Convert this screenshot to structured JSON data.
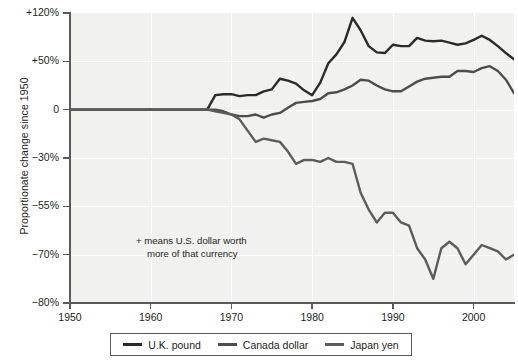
{
  "chart_data": {
    "type": "line",
    "title": "",
    "xlabel": "",
    "ylabel": "Proportionate change since 1950",
    "annotation": {
      "line1": "+ means U.S. dollar worth",
      "line2": "more of that currency"
    },
    "legend_position": "bottom",
    "grid": true,
    "background_color": "#f1f1ef",
    "gridline_color": "#ffffff",
    "axis_color": "#58595b",
    "xlim": [
      1950,
      2005
    ],
    "x_ticks": [
      1950,
      1960,
      1970,
      1980,
      1990,
      2000
    ],
    "x_tick_labels": [
      "1950",
      "1960",
      "1970",
      "1980",
      "1990",
      "2000"
    ],
    "y_ticks": [
      120,
      50,
      0,
      -30,
      -55,
      -70,
      -80
    ],
    "y_tick_labels": [
      "+120%",
      "+50%",
      "0",
      "-30%",
      "-55%",
      "-70%",
      "-80%"
    ],
    "y_axis_scale": "non-linear (equal pixel spacing between listed ticks)",
    "series": [
      {
        "name": "U.K. pound",
        "color": "#2b2b2b",
        "x": [
          1950,
          1951,
          1952,
          1953,
          1954,
          1955,
          1956,
          1957,
          1958,
          1959,
          1960,
          1961,
          1962,
          1963,
          1964,
          1965,
          1966,
          1967,
          1968,
          1969,
          1970,
          1971,
          1972,
          1973,
          1974,
          1975,
          1976,
          1977,
          1978,
          1979,
          1980,
          1981,
          1982,
          1983,
          1984,
          1985,
          1986,
          1987,
          1988,
          1989,
          1990,
          1991,
          1992,
          1993,
          1994,
          1995,
          1996,
          1997,
          1998,
          1999,
          2000,
          2001,
          2002,
          2003,
          2004,
          2005
        ],
        "y": [
          0,
          0,
          0,
          0,
          0,
          0,
          0,
          0,
          0,
          0,
          0,
          0,
          0,
          0,
          0,
          0,
          0,
          0,
          15,
          16,
          16,
          14,
          15,
          15,
          19,
          21,
          32,
          30,
          27,
          20,
          15,
          28,
          48,
          60,
          78,
          113,
          95,
          72,
          63,
          62,
          74,
          72,
          72,
          84,
          80,
          79,
          80,
          77,
          74,
          76,
          81,
          87,
          81,
          72,
          62,
          53
        ]
      },
      {
        "name": "Canada dollar",
        "color": "#4d4d4d",
        "x": [
          1950,
          1951,
          1952,
          1953,
          1954,
          1955,
          1956,
          1957,
          1958,
          1959,
          1960,
          1961,
          1962,
          1963,
          1964,
          1965,
          1966,
          1967,
          1968,
          1969,
          1970,
          1971,
          1972,
          1973,
          1974,
          1975,
          1976,
          1977,
          1978,
          1979,
          1980,
          1981,
          1982,
          1983,
          1984,
          1985,
          1986,
          1987,
          1988,
          1989,
          1990,
          1991,
          1992,
          1993,
          1994,
          1995,
          1996,
          1997,
          1998,
          1999,
          2000,
          2001,
          2002,
          2003,
          2004,
          2005
        ],
        "y": [
          0,
          0,
          0,
          0,
          0,
          0,
          0,
          0,
          0,
          0,
          0,
          0,
          0,
          0,
          0,
          0,
          0,
          0,
          0,
          -1,
          -3,
          -4,
          -4,
          -3,
          -5,
          -3,
          -2,
          2,
          7,
          8,
          9,
          11,
          17,
          18,
          21,
          25,
          31,
          30,
          25,
          21,
          19,
          19,
          24,
          29,
          32,
          33,
          34,
          34,
          40,
          40,
          39,
          43,
          45,
          40,
          31,
          17
        ]
      },
      {
        "name": "Japan yen",
        "color": "#5c5c5c",
        "x": [
          1950,
          1951,
          1952,
          1953,
          1954,
          1955,
          1956,
          1957,
          1958,
          1959,
          1960,
          1961,
          1962,
          1963,
          1964,
          1965,
          1966,
          1967,
          1968,
          1969,
          1970,
          1971,
          1972,
          1973,
          1974,
          1975,
          1976,
          1977,
          1978,
          1979,
          1980,
          1981,
          1982,
          1983,
          1984,
          1985,
          1986,
          1987,
          1988,
          1989,
          1990,
          1991,
          1992,
          1993,
          1994,
          1995,
          1996,
          1997,
          1998,
          1999,
          2000,
          2001,
          2002,
          2003,
          2004,
          2005
        ],
        "y": [
          0,
          0,
          0,
          0,
          0,
          0,
          0,
          0,
          0,
          0,
          0,
          0,
          0,
          0,
          0,
          0,
          0,
          0,
          -1,
          -2,
          -3,
          -6,
          -13,
          -20,
          -18,
          -19,
          -20,
          -26,
          -33,
          -31,
          -31,
          -32,
          -30,
          -32,
          -32,
          -33,
          -48,
          -56,
          -60,
          -57,
          -57,
          -60,
          -61,
          -68,
          -71,
          -75,
          -68,
          -66,
          -68,
          -72,
          -70,
          -67,
          -68,
          -69,
          -71,
          -70
        ]
      }
    ]
  },
  "legend": {
    "items": [
      {
        "label": "U.K. pound",
        "color": "#2b2b2b"
      },
      {
        "label": "Canada dollar",
        "color": "#4d4d4d"
      },
      {
        "label": "Japan yen",
        "color": "#5c5c5c"
      }
    ]
  }
}
